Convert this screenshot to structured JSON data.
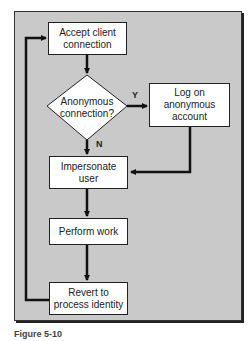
{
  "diagram": {
    "type": "flowchart",
    "nodes": [
      {
        "id": "accept",
        "shape": "process",
        "label": "Accept client connection",
        "lines": [
          "Accept client",
          "connection"
        ]
      },
      {
        "id": "decision",
        "shape": "decision",
        "label": "Anonymous connection?",
        "lines": [
          "Anonymous",
          "connection?"
        ]
      },
      {
        "id": "logon",
        "shape": "process",
        "label": "Log on anonymous account",
        "lines": [
          "Log on",
          "anonymous",
          "account"
        ]
      },
      {
        "id": "impersonate",
        "shape": "process",
        "label": "Impersonate user",
        "lines": [
          "Impersonate",
          "user"
        ]
      },
      {
        "id": "work",
        "shape": "process",
        "label": "Perform work",
        "lines": [
          "Perform work"
        ]
      },
      {
        "id": "revert",
        "shape": "process",
        "label": "Revert to process identity",
        "lines": [
          "Revert to",
          "process identity"
        ]
      }
    ],
    "edges": [
      {
        "from": "accept",
        "to": "decision",
        "label": ""
      },
      {
        "from": "decision",
        "to": "logon",
        "label": "Y"
      },
      {
        "from": "decision",
        "to": "impersonate",
        "label": "N"
      },
      {
        "from": "logon",
        "to": "impersonate",
        "label": ""
      },
      {
        "from": "impersonate",
        "to": "work",
        "label": ""
      },
      {
        "from": "work",
        "to": "revert",
        "label": ""
      },
      {
        "from": "revert",
        "to": "accept",
        "label": ""
      }
    ],
    "edge_labels": {
      "yes": "Y",
      "no": "N"
    },
    "caption": "Figure 5-10"
  }
}
